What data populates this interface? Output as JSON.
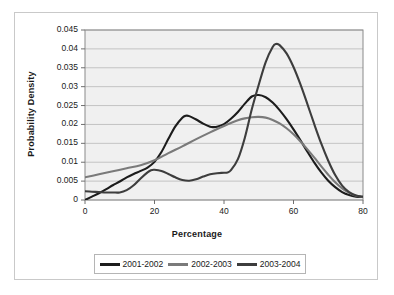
{
  "chart_data": {
    "type": "line",
    "title": "",
    "xlabel": "Percentage",
    "ylabel": "Probability Density",
    "xlim": [
      0,
      80
    ],
    "ylim": [
      0,
      0.045
    ],
    "xticks": [
      "0",
      "20",
      "40",
      "60",
      "80"
    ],
    "yticks": [
      "0",
      "0.005",
      "0.01",
      "0.015",
      "0.02",
      "0.025",
      "0.03",
      "0.035",
      "0.04",
      "0.045"
    ],
    "grid": "horizontal",
    "legend_position": "bottom",
    "plot_background": "#f0f0f0",
    "series": [
      {
        "name": "2001-2002",
        "color": "#1c1c1c",
        "x": [
          0,
          2,
          4,
          6,
          8,
          10,
          12,
          14,
          16,
          18,
          20,
          22,
          24,
          26,
          28,
          29,
          30,
          32,
          34,
          36,
          37,
          38,
          40,
          42,
          44,
          46,
          48,
          50,
          52,
          54,
          56,
          58,
          60,
          62,
          64,
          66,
          68,
          70,
          72,
          74,
          76,
          78,
          80
        ],
        "values": [
          0.0,
          0.0009,
          0.0018,
          0.0028,
          0.0039,
          0.0049,
          0.006,
          0.0069,
          0.0077,
          0.0086,
          0.0101,
          0.0127,
          0.0162,
          0.0195,
          0.0218,
          0.0223,
          0.0222,
          0.0213,
          0.0202,
          0.0194,
          0.0193,
          0.0194,
          0.0201,
          0.0215,
          0.0233,
          0.0255,
          0.0274,
          0.0278,
          0.0272,
          0.0258,
          0.0238,
          0.0214,
          0.0187,
          0.0158,
          0.0128,
          0.0099,
          0.0073,
          0.0051,
          0.0034,
          0.0021,
          0.0013,
          0.0009,
          0.0008
        ]
      },
      {
        "name": "2002-2003",
        "color": "#7a7a7a",
        "x": [
          0,
          4,
          8,
          12,
          16,
          20,
          24,
          28,
          32,
          36,
          40,
          42,
          44,
          46,
          48,
          50,
          52,
          54,
          56,
          58,
          60,
          62,
          64,
          66,
          68,
          70,
          72,
          74,
          76,
          78,
          80
        ],
        "values": [
          0.006,
          0.0068,
          0.0076,
          0.0084,
          0.0092,
          0.0105,
          0.0124,
          0.0142,
          0.0161,
          0.0179,
          0.0196,
          0.0204,
          0.0211,
          0.0216,
          0.0219,
          0.022,
          0.0218,
          0.0212,
          0.0203,
          0.019,
          0.0174,
          0.0155,
          0.0134,
          0.0112,
          0.0089,
          0.0067,
          0.0047,
          0.0031,
          0.0019,
          0.0011,
          0.0008
        ]
      },
      {
        "name": "2003-2004",
        "color": "#3d3d3d",
        "x": [
          0,
          2,
          4,
          6,
          8,
          10,
          12,
          14,
          16,
          18,
          19,
          20,
          22,
          24,
          26,
          28,
          30,
          32,
          34,
          36,
          38,
          40,
          41,
          42,
          44,
          46,
          48,
          50,
          52,
          54,
          55,
          56,
          58,
          60,
          62,
          64,
          66,
          68,
          70,
          72,
          74,
          76,
          78,
          80
        ],
        "values": [
          0.0023,
          0.0022,
          0.0021,
          0.002,
          0.002,
          0.002,
          0.0026,
          0.0039,
          0.0057,
          0.0073,
          0.0079,
          0.008,
          0.0077,
          0.0069,
          0.006,
          0.0053,
          0.0051,
          0.0055,
          0.0062,
          0.0068,
          0.0071,
          0.0072,
          0.0073,
          0.0079,
          0.0108,
          0.0165,
          0.024,
          0.0305,
          0.0365,
          0.0405,
          0.0413,
          0.041,
          0.0388,
          0.0352,
          0.0306,
          0.0254,
          0.02,
          0.0149,
          0.0104,
          0.0066,
          0.0038,
          0.0021,
          0.0012,
          0.0009
        ]
      }
    ]
  },
  "legend": {
    "items": [
      {
        "label": "2001-2002",
        "color": "#1c1c1c"
      },
      {
        "label": "2002-2003",
        "color": "#7a7a7a"
      },
      {
        "label": "2003-2004",
        "color": "#3d3d3d"
      }
    ]
  }
}
